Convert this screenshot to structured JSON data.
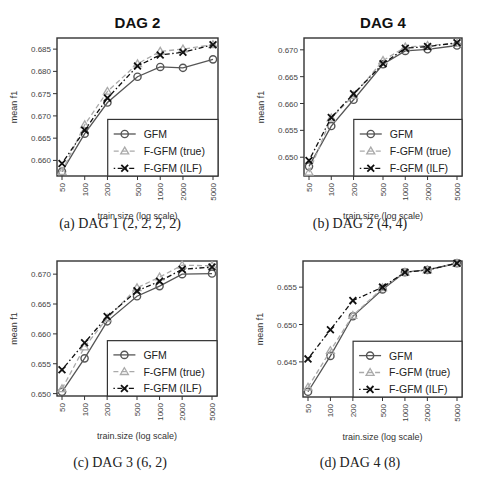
{
  "chart_data": [
    {
      "type": "line",
      "title": "DAG 2",
      "caption": "(a) DAG 1 (2, 2, 2, 2)",
      "xlabel": "train.size (log scale)",
      "ylabel": "mean f1",
      "x": [
        50,
        100,
        200,
        500,
        1000,
        2000,
        5000
      ],
      "x_tick_labels": [
        "50",
        "100",
        "200",
        "500",
        "1000",
        "2000",
        "5000"
      ],
      "y_ticks": [
        0.66,
        0.665,
        0.67,
        0.675,
        0.68,
        0.685
      ],
      "y_tick_labels": [
        "0.660",
        "0.665",
        "0.670",
        "0.675",
        "0.680",
        "0.685"
      ],
      "ylim": [
        0.6565,
        0.6875
      ],
      "grid": false,
      "legend_position": "bottom-right",
      "series": [
        {
          "name": "GFM",
          "marker": "circle",
          "line": "solid",
          "color": "#555555",
          "values": [
            0.6575,
            0.666,
            0.673,
            0.6788,
            0.681,
            0.6808,
            0.6827
          ]
        },
        {
          "name": "F-GFM (true)",
          "marker": "triangle",
          "line": "dashed",
          "color": "#aaaaaa",
          "values": [
            0.6575,
            0.668,
            0.6755,
            0.6817,
            0.6845,
            0.685,
            0.686
          ]
        },
        {
          "name": "F-GFM (ILF)",
          "marker": "x",
          "line": "dotdash",
          "color": "#111111",
          "values": [
            0.6593,
            0.6668,
            0.674,
            0.6812,
            0.6837,
            0.6843,
            0.686
          ]
        }
      ]
    },
    {
      "type": "line",
      "title": "DAG 4",
      "caption": "(b) DAG 2 (4, 4)",
      "xlabel": "train.size (log scale)",
      "ylabel": "mean f1",
      "x": [
        50,
        100,
        200,
        500,
        1000,
        2000,
        5000
      ],
      "x_tick_labels": [
        "50",
        "100",
        "200",
        "500",
        "1000",
        "2000",
        "5000"
      ],
      "y_ticks": [
        0.65,
        0.655,
        0.66,
        0.665,
        0.67
      ],
      "y_tick_labels": [
        "0.650",
        "0.655",
        "0.660",
        "0.665",
        "0.670"
      ],
      "ylim": [
        0.6465,
        0.6722
      ],
      "grid": false,
      "legend_position": "bottom-right",
      "series": [
        {
          "name": "GFM",
          "marker": "circle",
          "line": "solid",
          "color": "#555555",
          "values": [
            0.6483,
            0.6558,
            0.6607,
            0.6673,
            0.6698,
            0.6701,
            0.6708
          ]
        },
        {
          "name": "F-GFM (true)",
          "marker": "triangle",
          "line": "dashed",
          "color": "#aaaaaa",
          "values": [
            0.6472,
            0.6573,
            0.6615,
            0.668,
            0.6705,
            0.6708,
            0.6712
          ]
        },
        {
          "name": "F-GFM (ILF)",
          "marker": "x",
          "line": "dotdash",
          "color": "#111111",
          "values": [
            0.6494,
            0.6574,
            0.6618,
            0.6674,
            0.6703,
            0.6706,
            0.6713
          ]
        }
      ]
    },
    {
      "type": "line",
      "title": "",
      "caption": "(c) DAG 3 (6, 2)",
      "xlabel": "train.size (log scale)",
      "ylabel": "mean f1",
      "x": [
        50,
        100,
        200,
        500,
        1000,
        2000,
        5000
      ],
      "x_tick_labels": [
        "50",
        "100",
        "200",
        "500",
        "1000",
        "2000",
        "5000"
      ],
      "y_ticks": [
        0.65,
        0.655,
        0.66,
        0.665,
        0.67
      ],
      "y_tick_labels": [
        "0.650",
        "0.655",
        "0.660",
        "0.665",
        "0.670"
      ],
      "ylim": [
        0.6496,
        0.6722
      ],
      "grid": false,
      "legend_position": "bottom-right",
      "series": [
        {
          "name": "GFM",
          "marker": "circle",
          "line": "solid",
          "color": "#555555",
          "values": [
            0.6503,
            0.6559,
            0.6621,
            0.6663,
            0.668,
            0.67,
            0.6701
          ]
        },
        {
          "name": "F-GFM (true)",
          "marker": "triangle",
          "line": "dashed",
          "color": "#aaaaaa",
          "values": [
            0.6508,
            0.6578,
            0.6626,
            0.6677,
            0.6695,
            0.6715,
            0.6714
          ]
        },
        {
          "name": "F-GFM (ILF)",
          "marker": "x",
          "line": "dotdash",
          "color": "#111111",
          "values": [
            0.654,
            0.6585,
            0.6629,
            0.6672,
            0.6688,
            0.6708,
            0.6712
          ]
        }
      ]
    },
    {
      "type": "line",
      "title": "",
      "caption": "(d) DAG 4 (8)",
      "xlabel": "train.size (log scale)",
      "ylabel": "mean f1",
      "x": [
        50,
        100,
        200,
        500,
        1000,
        2000,
        5000
      ],
      "x_tick_labels": [
        "50",
        "100",
        "200",
        "500",
        "1000",
        "2000",
        "5000"
      ],
      "y_ticks": [
        0.645,
        0.65,
        0.655
      ],
      "y_tick_labels": [
        "0.645",
        "0.650",
        "0.655"
      ],
      "ylim": [
        0.6403,
        0.6585
      ],
      "grid": false,
      "legend_position": "bottom-right",
      "series": [
        {
          "name": "GFM",
          "marker": "circle",
          "line": "solid",
          "color": "#555555",
          "values": [
            0.641,
            0.6458,
            0.6511,
            0.6547,
            0.657,
            0.6573,
            0.6582
          ]
        },
        {
          "name": "F-GFM (true)",
          "marker": "triangle",
          "line": "dashed",
          "color": "#aaaaaa",
          "values": [
            0.6416,
            0.6465,
            0.6512,
            0.6549,
            0.657,
            0.6573,
            0.6582
          ]
        },
        {
          "name": "F-GFM (ILF)",
          "marker": "x",
          "line": "dotdash",
          "color": "#111111",
          "values": [
            0.6454,
            0.6493,
            0.6532,
            0.655,
            0.657,
            0.6573,
            0.6582
          ]
        }
      ]
    }
  ],
  "panels": [
    {
      "caption": "(a) DAG 1 (2, 2, 2, 2)"
    },
    {
      "caption": "(b) DAG 2 (4, 4)"
    },
    {
      "caption": "(c) DAG 3 (6, 2)"
    },
    {
      "caption": "(d) DAG 4 (8)"
    }
  ]
}
